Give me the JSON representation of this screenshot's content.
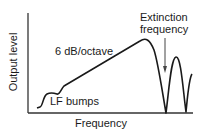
{
  "diagram": {
    "y_axis_label": "Output level",
    "x_axis_label": "Frequency",
    "annotations": {
      "slope": "6 dB/octave",
      "low_freq": "LF bumps",
      "extinction_line1": "Extinction",
      "extinction_line2": "frequency"
    },
    "colors": {
      "line": "#1a1a1a",
      "axis": "#333333",
      "arrow": "#444444"
    }
  }
}
